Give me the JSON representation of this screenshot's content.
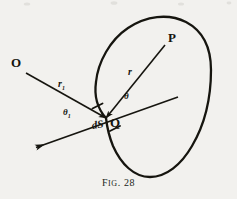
{
  "figure": {
    "caption_prefix": "F",
    "caption_small": "IG",
    "caption_rest": ". 28",
    "caption_full": "FIG. 28",
    "background_color": "#f2f1ee",
    "ink_color": "#16150f"
  },
  "labels": {
    "point_O": "O",
    "point_P": "P",
    "point_Q": "Q",
    "surface_element": "dS",
    "radius_outer": "r",
    "radius_outer_sub": "1",
    "radius_inner": "r",
    "angle_outer": "θ",
    "angle_outer_sub": "1",
    "angle_inner": "θ"
  },
  "geometry": {
    "point_O": [
      25,
      72
    ],
    "point_P": [
      166,
      44
    ],
    "point_Q": [
      106,
      118
    ],
    "tangent_left_end": [
      33,
      149
    ],
    "tangent_right_end": [
      178,
      97
    ],
    "ds_tick_upper": [
      96,
      106
    ],
    "ds_tick_lower": [
      115,
      128
    ],
    "closed_curve_description": "pear-shaped closed contour, apex near top center, widest near y=95, rounded base near y=175"
  },
  "icons": {
    "arrowhead": "arrowhead-icon",
    "tick": "tick-mark-icon"
  }
}
